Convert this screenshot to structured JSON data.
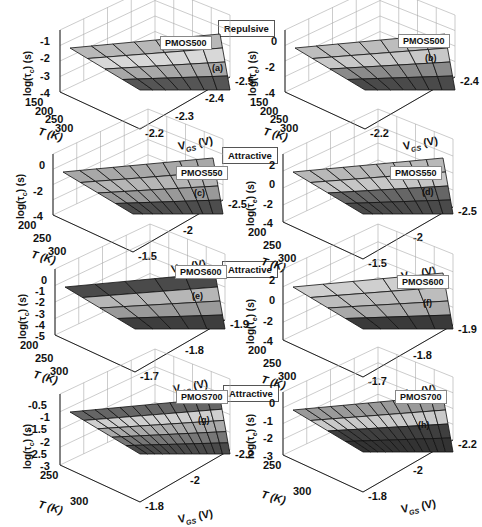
{
  "figure": {
    "tags": {
      "row1": "Repulsive",
      "row2": "Attractive",
      "row3": "Attractive",
      "row4": "Attractive"
    }
  },
  "chart_data": [
    {
      "id": "a",
      "type": "surface3d",
      "device": "PMOS500",
      "label": "(a)",
      "interaction": "Repulsive",
      "zlabel": "log(τc) (s)",
      "xlabel": "T (K)",
      "ylabel": "VGS (V)",
      "x_ticks": [
        "150",
        "200",
        "250",
        "300"
      ],
      "y_ticks": [
        "-2.2",
        "-2.3",
        "-2.4",
        "-2.5"
      ],
      "z_ticks": [
        "-1",
        "-2",
        "-3",
        "-4"
      ],
      "zlim": [
        -4,
        -1
      ],
      "bands": [
        -1.5,
        -2.3,
        -3.3
      ],
      "grid": true
    },
    {
      "id": "b",
      "type": "surface3d",
      "device": "PMOS500",
      "label": "(b)",
      "interaction": "Repulsive",
      "zlabel": "log(τe) (s)",
      "xlabel": "T (K)",
      "ylabel": "VGS (V)",
      "x_ticks": [
        "150",
        "200",
        "250",
        "300"
      ],
      "y_ticks": [
        "-2.2",
        "-2.4"
      ],
      "z_ticks": [
        "0",
        "-2",
        "-4"
      ],
      "zlim": [
        -4,
        0
      ],
      "bands": [
        -1.5,
        -3,
        -4
      ],
      "grid": true
    },
    {
      "id": "c",
      "type": "surface3d",
      "device": "PMOS550",
      "label": "(c)",
      "interaction": "Attractive",
      "zlabel": "log(τc) (s)",
      "xlabel": "T (K)",
      "ylabel": "VGS (V)",
      "x_ticks": [
        "200",
        "250",
        "300"
      ],
      "y_ticks": [
        "-1.5",
        "-2",
        "-2.5"
      ],
      "z_ticks": [
        "0",
        "-2",
        "-4"
      ],
      "zlim": [
        -4,
        0
      ],
      "bands": [
        -0.5,
        -1.5,
        -2.5,
        -3.7
      ],
      "grid": true
    },
    {
      "id": "d",
      "type": "surface3d",
      "device": "PMOS550",
      "label": "(d)",
      "interaction": "Attractive",
      "zlabel": "log(τe) (s)",
      "xlabel": "T (K)",
      "ylabel": "VGS (V)",
      "x_ticks": [
        "200",
        "250",
        "300"
      ],
      "y_ticks": [
        "-1.5",
        "-2",
        "-2.5"
      ],
      "z_ticks": [
        "2",
        "0",
        "-2",
        "-4"
      ],
      "zlim": [
        -4,
        2
      ],
      "bands": [
        0,
        -1.5,
        -3,
        -4
      ],
      "grid": true
    },
    {
      "id": "e",
      "type": "surface3d",
      "device": "PMOS600",
      "label": "(e)",
      "interaction": "Attractive",
      "zlabel": "log(τc) (s)",
      "xlabel": "T (K)",
      "ylabel": "VGS (V)",
      "x_ticks": [
        "200",
        "250",
        "300"
      ],
      "y_ticks": [
        "-1.7",
        "-1.8",
        "-1.9"
      ],
      "z_ticks": [
        "0",
        "-1",
        "-2",
        "-3",
        "-4",
        "-5"
      ],
      "zlim": [
        -5,
        0
      ],
      "bands": [
        -0.5,
        -2,
        -3.3,
        -4.5
      ],
      "grid": true
    },
    {
      "id": "f",
      "type": "surface3d",
      "device": "PMOS600",
      "label": "(f)",
      "interaction": "Attractive",
      "zlabel": "log(τe) (s)",
      "xlabel": "T (K)",
      "ylabel": "VGS (V)",
      "x_ticks": [
        "200",
        "250",
        "300"
      ],
      "y_ticks": [
        "-1.7",
        "-1.8",
        "-1.9"
      ],
      "z_ticks": [
        "2",
        "0",
        "-2",
        "-4"
      ],
      "zlim": [
        -4,
        2
      ],
      "bands": [
        0,
        -1,
        -2,
        -3.5
      ],
      "grid": true
    },
    {
      "id": "g",
      "type": "surface3d",
      "device": "PMOS700",
      "label": "(g)",
      "interaction": "Attractive",
      "zlabel": "log(τc) (s)",
      "xlabel": "T (K)",
      "ylabel": "VGS (V)",
      "x_ticks": [
        "250",
        "300"
      ],
      "y_ticks": [
        "-1.8",
        "-2",
        "-2.2"
      ],
      "z_ticks": [
        "-0.5",
        "-1",
        "-1.5",
        "-2",
        "-2.5",
        "-3"
      ],
      "zlim": [
        -3,
        -0.5
      ],
      "bands": [
        -0.8,
        -1.3,
        -1.8,
        -2.3,
        -2.8
      ],
      "grid": true
    },
    {
      "id": "h",
      "type": "surface3d",
      "device": "PMOS700",
      "label": "(h)",
      "interaction": "Attractive",
      "zlabel": "log(τe) (s)",
      "xlabel": "T (K)",
      "ylabel": "VGS (V)",
      "x_ticks": [
        "250",
        "300"
      ],
      "y_ticks": [
        "-1.8",
        "-2",
        "-2.2"
      ],
      "z_ticks": [
        "0",
        "-1",
        "-2",
        "-3"
      ],
      "zlim": [
        -3,
        0
      ],
      "bands": [
        -0.8,
        -1.5,
        -2.5,
        -3
      ],
      "grid": true
    }
  ],
  "panels": {
    "a": {
      "device": "PMOS500",
      "label": "(a)",
      "ylab": "log(τ",
      "ysub": "c",
      "yend": ") (s)",
      "zt": [
        "-1",
        "-2",
        "-3",
        "-4"
      ],
      "xt": [
        "150",
        "200",
        "250",
        "300"
      ],
      "vt": [
        "-2.2",
        "-2.3",
        "-2.4",
        "-2.5"
      ],
      "xl": "T (K)",
      "vl": "V",
      "vsub": "GS",
      "vend": " (V)"
    },
    "b": {
      "device": "PMOS500",
      "label": "(b)",
      "ylab": "log(τ",
      "ysub": "e",
      "yend": ") (s)",
      "zt": [
        "0",
        "-2",
        "-4"
      ],
      "xt": [
        "150",
        "200",
        "250",
        "300"
      ],
      "vt": [
        "-2.2",
        "-2.4"
      ],
      "xl": "T (K)",
      "vl": "V",
      "vsub": "GS",
      "vend": " (V)"
    },
    "c": {
      "device": "PMOS550",
      "label": "(c)",
      "ylab": "log(τ",
      "ysub": "c",
      "yend": ") (s)",
      "zt": [
        "0",
        "-2",
        "-4"
      ],
      "xt": [
        "200",
        "250",
        "300"
      ],
      "vt": [
        "-1.5",
        "-2",
        "-2.5"
      ],
      "xl": "T (K)",
      "vl": "V",
      "vsub": "GS",
      "vend": " (V)"
    },
    "d": {
      "device": "PMOS550",
      "label": "(d)",
      "ylab": "log(τ",
      "ysub": "e",
      "yend": ") (s)",
      "zt": [
        "2",
        "0",
        "-2",
        "-4"
      ],
      "xt": [
        "200",
        "250",
        "300"
      ],
      "vt": [
        "-1.5",
        "-2",
        "-2.5"
      ],
      "xl": "T (K)",
      "vl": "V",
      "vsub": "GS",
      "vend": " (V)"
    },
    "e": {
      "device": "PMOS600",
      "label": "(e)",
      "ylab": "log(τ",
      "ysub": "c",
      "yend": ") (s)",
      "zt": [
        "0",
        "-1",
        "-2",
        "-3",
        "-4",
        "-5"
      ],
      "xt": [
        "200",
        "250",
        "300"
      ],
      "vt": [
        "-1.7",
        "-1.8",
        "-1.9"
      ],
      "xl": "T (K)",
      "vl": "V",
      "vsub": "GS",
      "vend": " (V)"
    },
    "f": {
      "device": "PMOS600",
      "label": "(f)",
      "ylab": "log(τ",
      "ysub": "e",
      "yend": ") (s)",
      "zt": [
        "2",
        "0",
        "-2",
        "-4"
      ],
      "xt": [
        "200",
        "250",
        "300"
      ],
      "vt": [
        "-1.7",
        "-1.8",
        "-1.9"
      ],
      "xl": "T (K)",
      "vl": "V",
      "vsub": "GS",
      "vend": " (V)"
    },
    "g": {
      "device": "PMOS700",
      "label": "(g)",
      "ylab": "log(τ",
      "ysub": "c",
      "yend": ") (s)",
      "zt": [
        "-0.5",
        "-1",
        "-1.5",
        "-2",
        "-2.5",
        "-3"
      ],
      "xt": [
        "250",
        "300"
      ],
      "vt": [
        "-1.8",
        "-2",
        "-2.2"
      ],
      "xl": "T (K)",
      "vl": "V",
      "vsub": "GS",
      "vend": " (V)"
    },
    "h": {
      "device": "PMOS700",
      "label": "(h)",
      "ylab": "log(τ",
      "ysub": "e",
      "yend": ") (s)",
      "zt": [
        "0",
        "-1",
        "-2",
        "-3"
      ],
      "xt": [
        "250",
        "300"
      ],
      "vt": [
        "-1.8",
        "-2",
        "-2.2"
      ],
      "xl": "T (K)",
      "vl": "V",
      "vsub": "GS",
      "vend": " (V)"
    }
  }
}
